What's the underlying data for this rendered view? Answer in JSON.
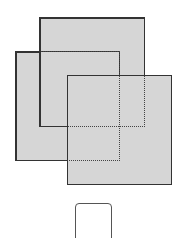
{
  "diagram": {
    "colors": {
      "fill": "#d6d6d6",
      "border": "#333333",
      "dotted": "#444444",
      "background": "#ffffff"
    },
    "shapes": [
      {
        "id": "back-square",
        "x": 39,
        "y": 17,
        "w": 106,
        "h": 110
      },
      {
        "id": "left-square",
        "x": 15,
        "y": 51,
        "w": 105,
        "h": 110
      },
      {
        "id": "front-square",
        "x": 67,
        "y": 75,
        "w": 105,
        "h": 110
      }
    ],
    "small_card": {
      "x": 75,
      "y": 203,
      "w": 37,
      "h": 40
    }
  }
}
